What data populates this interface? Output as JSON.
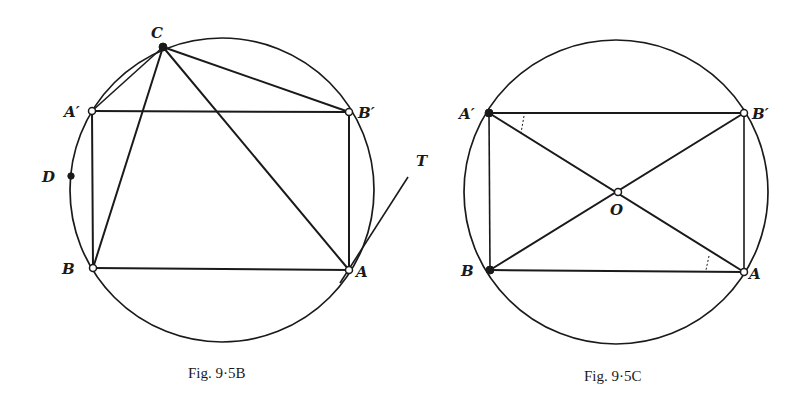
{
  "figures": [
    {
      "id": "fig-9-5B",
      "caption": "Fig. 9·5B",
      "circle": {
        "cx": 222,
        "cy": 190,
        "r": 152
      },
      "points": {
        "C": {
          "label": "C",
          "x": 163,
          "y": 47,
          "style": "filled"
        },
        "A1": {
          "label": "A′",
          "x": 92,
          "y": 111,
          "style": "open"
        },
        "B1": {
          "label": "B′",
          "x": 349,
          "y": 112,
          "style": "open"
        },
        "B": {
          "label": "B",
          "x": 93,
          "y": 268,
          "style": "open"
        },
        "A": {
          "label": "A",
          "x": 349,
          "y": 270,
          "style": "open"
        },
        "D": {
          "label": "D",
          "x": 71,
          "y": 176,
          "style": "filled"
        },
        "T": {
          "label": "T",
          "x": 408,
          "y": 177,
          "style": "none"
        }
      },
      "segments": [
        "A′B′",
        "B′A",
        "AB",
        "BA′",
        "CA′",
        "CB",
        "CA",
        "CB′",
        "AT"
      ]
    },
    {
      "id": "fig-9-5C",
      "caption": "Fig. 9·5C",
      "circle": {
        "cx": 616,
        "cy": 192,
        "r": 152
      },
      "points": {
        "A1": {
          "label": "A′",
          "x": 489,
          "y": 113,
          "style": "filled"
        },
        "B1": {
          "label": "B′",
          "x": 744,
          "y": 113,
          "style": "open"
        },
        "B": {
          "label": "B",
          "x": 490,
          "y": 270,
          "style": "filled"
        },
        "A": {
          "label": "A",
          "x": 744,
          "y": 272,
          "style": "open"
        },
        "O": {
          "label": "O",
          "x": 618,
          "y": 192,
          "style": "open"
        }
      },
      "segments": [
        "A′B′",
        "B′A",
        "AB",
        "BA′",
        "A′A",
        "BB′"
      ],
      "angle_marks": [
        "angle at A′ between A′B′ and A′A",
        "angle at A between AB and AA′"
      ]
    }
  ]
}
